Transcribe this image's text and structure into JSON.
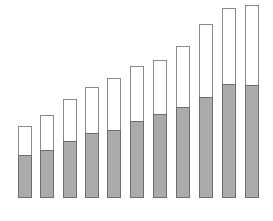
{
  "chart_data": {
    "type": "bar",
    "stacked": true,
    "title": "",
    "xlabel": "",
    "ylabel": "",
    "grid": false,
    "legend": null,
    "categories": [
      "1",
      "2",
      "3",
      "4",
      "5",
      "6",
      "7",
      "8",
      "9",
      "10",
      "11"
    ],
    "series": [
      {
        "name": "lower",
        "color": "#ababab",
        "values": [
          43,
          48,
          57,
          65,
          68,
          77,
          84,
          91,
          101,
          114,
          113
        ]
      },
      {
        "name": "upper",
        "color": "#ffffff",
        "values": [
          29,
          35,
          42,
          46,
          52,
          55,
          54,
          61,
          73,
          76,
          80
        ]
      }
    ],
    "totals": [
      72,
      83,
      99,
      111,
      120,
      132,
      138,
      152,
      174,
      190,
      193
    ],
    "ylim": [
      0,
      200
    ],
    "layout": {
      "baseline_px": 198,
      "bar_width_px": 14,
      "bar_x_px": [
        18,
        40,
        63,
        85,
        107,
        130,
        153,
        176,
        199,
        222,
        245
      ]
    }
  }
}
